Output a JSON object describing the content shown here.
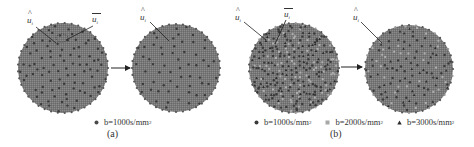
{
  "figure": {
    "panels": [
      {
        "id": "a",
        "caption": "(a)",
        "left_sphere": {
          "cx": 63,
          "cy": 68,
          "r": 45,
          "point_count_est": 90
        },
        "right_sphere": {
          "cx": 176,
          "cy": 68,
          "r": 44,
          "point_count_est": 60
        },
        "labels": {
          "u_hat": {
            "base": "u",
            "sub": "i",
            "accent": "hat"
          },
          "u_bar": {
            "base": "u",
            "sub": "i",
            "accent": "bar"
          }
        },
        "right_labels": {
          "u_hat": {
            "base": "u",
            "sub": "i",
            "accent": "hat"
          }
        },
        "legend": [
          {
            "marker": "circle",
            "color": "#4a4a4a",
            "text": "b=1000s/mm",
            "sup": "2"
          }
        ]
      },
      {
        "id": "b",
        "caption": "(b)",
        "left_sphere": {
          "cx": 294,
          "cy": 68,
          "r": 45,
          "point_count_est": 270
        },
        "right_sphere": {
          "cx": 409,
          "cy": 69,
          "r": 44,
          "point_count_est": 120
        },
        "labels": {
          "u_hat": {
            "base": "u",
            "sub": "i",
            "accent": "hat"
          },
          "u_bar": {
            "base": "u",
            "sub": "i",
            "accent": "bar"
          }
        },
        "right_labels": {
          "u_hat": {
            "base": "u",
            "sub": "i",
            "accent": "hat"
          }
        },
        "legend": [
          {
            "marker": "circle",
            "color": "#3a3a3a",
            "text": "b=1000s/mm",
            "sup": "2"
          },
          {
            "marker": "square",
            "color": "#a8a8a8",
            "text": "b=2000s/mm",
            "sup": "2"
          },
          {
            "marker": "triangle",
            "color": "#2a2a2a",
            "text": "b=3000s/mm",
            "sup": "2"
          }
        ]
      }
    ],
    "colors": {
      "sphere_fill": "#7a7a7a",
      "sphere_texture": "#8a8a8a",
      "point_dark": "#3a3a3a",
      "point_light": "#b0b0b0",
      "arrow": "#222222",
      "text": "#333333"
    }
  }
}
